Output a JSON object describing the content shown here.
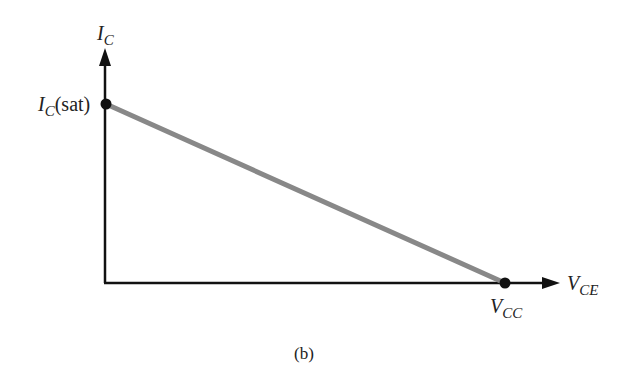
{
  "diagram": {
    "type": "dc-load-line",
    "caption": "(b)",
    "y_axis": {
      "symbol": "I",
      "subscript": "C"
    },
    "x_axis": {
      "symbol": "V",
      "subscript": "CE"
    },
    "points": [
      {
        "id": "saturation",
        "symbol": "I",
        "subscript": "C",
        "suffix": "(sat)"
      },
      {
        "id": "cutoff",
        "symbol": "V",
        "subscript": "CC"
      }
    ],
    "colors": {
      "axes": "#111111",
      "load_line": "#888888",
      "points": "#111111"
    }
  }
}
